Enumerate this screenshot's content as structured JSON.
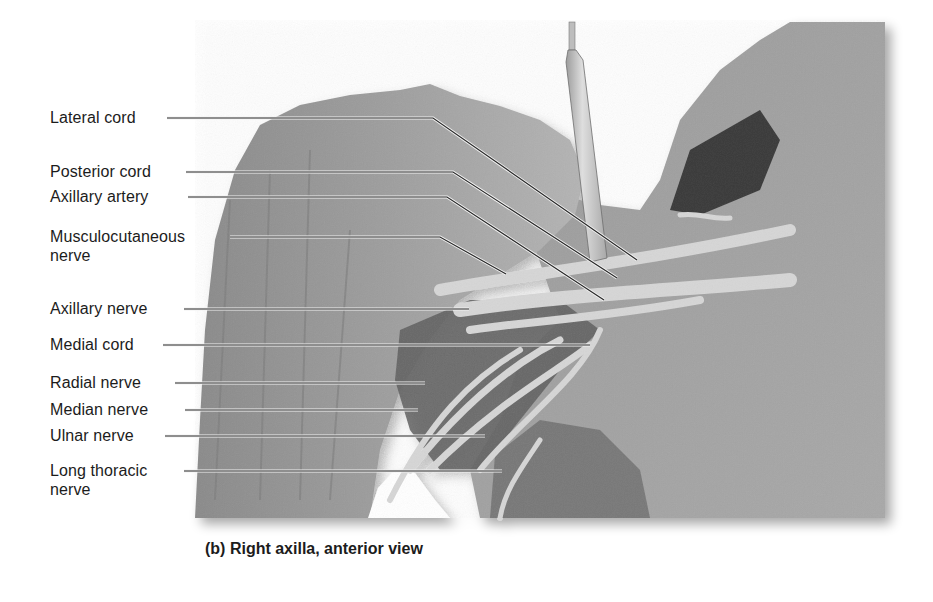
{
  "figure": {
    "caption": "(b) Right axilla, anterior view",
    "photo": {
      "description": "grayscale cadaver dissection photograph of right axilla with scalpel handle inserted",
      "bounds": {
        "x": 195,
        "y": 20,
        "width": 690,
        "height": 498
      }
    },
    "labels": [
      {
        "id": "lateral-cord",
        "lines": [
          "Lateral cord"
        ],
        "x": 50,
        "y": 108,
        "line": [
          [
            167,
            118
          ],
          [
            433,
            118
          ],
          [
            637,
            260
          ]
        ]
      },
      {
        "id": "posterior-cord",
        "lines": [
          "Posterior cord"
        ],
        "x": 50,
        "y": 162,
        "line": [
          [
            186,
            172
          ],
          [
            453,
            172
          ],
          [
            617,
            278
          ]
        ]
      },
      {
        "id": "axillary-artery",
        "lines": [
          "Axillary artery"
        ],
        "x": 50,
        "y": 187,
        "line": [
          [
            188,
            197
          ],
          [
            447,
            197
          ],
          [
            604,
            300
          ]
        ]
      },
      {
        "id": "musculocutaneous-nerve",
        "lines": [
          "Musculocutaneous",
          "nerve"
        ],
        "x": 50,
        "y": 227,
        "line": [
          [
            230,
            237
          ],
          [
            440,
            237
          ],
          [
            506,
            274
          ]
        ]
      },
      {
        "id": "axillary-nerve",
        "lines": [
          "Axillary nerve"
        ],
        "x": 50,
        "y": 299,
        "line": [
          [
            184,
            309
          ],
          [
            469,
            309
          ]
        ]
      },
      {
        "id": "medial-cord",
        "lines": [
          "Medial cord"
        ],
        "x": 50,
        "y": 335,
        "line": [
          [
            163,
            345
          ],
          [
            590,
            345
          ]
        ]
      },
      {
        "id": "radial-nerve",
        "lines": [
          "Radial nerve"
        ],
        "x": 50,
        "y": 373,
        "line": [
          [
            175,
            383
          ],
          [
            425,
            383
          ]
        ]
      },
      {
        "id": "median-nerve",
        "lines": [
          "Median nerve"
        ],
        "x": 50,
        "y": 400,
        "line": [
          [
            185,
            410
          ],
          [
            418,
            410
          ]
        ]
      },
      {
        "id": "ulnar-nerve",
        "lines": [
          "Ulnar nerve"
        ],
        "x": 50,
        "y": 426,
        "line": [
          [
            165,
            436
          ],
          [
            485,
            436
          ]
        ]
      },
      {
        "id": "long-thoracic-nerve",
        "lines": [
          "Long thoracic",
          "nerve"
        ],
        "x": 50,
        "y": 461,
        "line": [
          [
            184,
            471
          ],
          [
            502,
            471
          ]
        ]
      }
    ],
    "colors": {
      "background": "#ffffff",
      "text": "#1c1c1c",
      "leader_dark": "#2a2a2a",
      "leader_halo": "#f2f2f2"
    }
  }
}
